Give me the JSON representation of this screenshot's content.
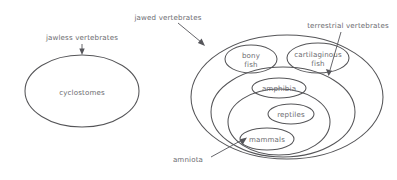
{
  "diagram": {
    "type": "euler-diagram",
    "background_color": "#ffffff",
    "stroke_color": "#555558",
    "text_color": "#6b6b70",
    "sets": [
      {
        "id": "cyclostomes",
        "label": "cyclostomes",
        "parent": null,
        "cx": 82,
        "cy": 91,
        "rx": 57,
        "ry": 36,
        "label_x": 82,
        "label_y": 93
      },
      {
        "id": "jawed",
        "label": "",
        "parent": null,
        "cx": 287,
        "cy": 97,
        "rx": 96,
        "ry": 62,
        "label_x": 0,
        "label_y": 0
      },
      {
        "id": "terrestrial",
        "label": "",
        "parent": "jawed",
        "cx": 283,
        "cy": 112,
        "rx": 72,
        "ry": 45,
        "label_x": 0,
        "label_y": 0
      },
      {
        "id": "amniota",
        "label": "",
        "parent": "terrestrial",
        "cx": 279,
        "cy": 122,
        "rx": 51,
        "ry": 33,
        "label_x": 0,
        "label_y": 0
      },
      {
        "id": "bony-fish",
        "label": "bony fish",
        "label_line1": "bony",
        "label_line2": "fish",
        "parent": "jawed",
        "cx": 251,
        "cy": 59,
        "rx": 26,
        "ry": 14,
        "label_x": 251,
        "label_y": 57
      },
      {
        "id": "cartilaginous-fish",
        "label": "cartilaginous fish",
        "label_line1": "cartilaginous",
        "label_line2": "fish",
        "parent": "jawed",
        "cx": 318,
        "cy": 58,
        "rx": 31,
        "ry": 15,
        "label_x": 318,
        "label_y": 56
      },
      {
        "id": "amphibia",
        "label": "amphibia",
        "parent": "terrestrial",
        "cx": 279,
        "cy": 88,
        "rx": 27,
        "ry": 10,
        "label_x": 279,
        "label_y": 90
      },
      {
        "id": "reptiles",
        "label": "reptiles",
        "parent": "amniota",
        "cx": 291,
        "cy": 114,
        "rx": 23,
        "ry": 10,
        "label_x": 291,
        "label_y": 116
      },
      {
        "id": "mammals",
        "label": "mammals",
        "parent": "amniota",
        "cx": 267,
        "cy": 139,
        "rx": 27,
        "ry": 11,
        "label_x": 267,
        "label_y": 141
      }
    ],
    "annotations": [
      {
        "id": "jawless-vertebrates",
        "text": "jawless vertebrates",
        "text_x": 82,
        "text_y": 38,
        "anchor": "middle",
        "line": "M 82 43 L 82 53",
        "arrow": "M 82 56 L 79.2 49.5 L 84.8 49.5 Z"
      },
      {
        "id": "jawed-vertebrates",
        "text": "jawed vertebrates",
        "text_x": 168,
        "text_y": 18,
        "anchor": "middle",
        "line": "M 178 23 L 202 44",
        "arrow": "M 205 47 L 198.6 43.6 L 202.4 39.3 Z"
      },
      {
        "id": "terrestrial-vertebrates",
        "text": "terrestrial vertebrates",
        "text_x": 348,
        "text_y": 26,
        "anchor": "middle",
        "line": "M 341 31 L 329 73",
        "arrow": "M 328 77 L 325.3 70.5 L 331.1 72.1 Z"
      },
      {
        "id": "amniota",
        "text": "amniota",
        "text_x": 188,
        "text_y": 160,
        "anchor": "middle",
        "line": "M 210 158 L 243 140",
        "arrow": "M 246 138 L 239.4 140.2 L 241.9 145.3 Z"
      }
    ]
  }
}
